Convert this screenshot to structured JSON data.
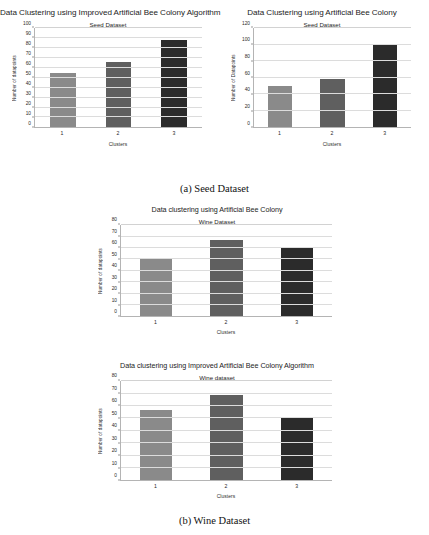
{
  "page": {
    "captions": [
      {
        "id": "a",
        "text": "(a) Seed Dataset"
      },
      {
        "id": "b",
        "text": "(b) Wine Dataset"
      }
    ]
  },
  "palette": {
    "bar_cluster_1": "#8a8a8a",
    "bar_cluster_2": "#5f5f5f",
    "bar_cluster_3": "#2b2b2b",
    "gridline": "#dcdcdc",
    "axis": "#b4b4b4",
    "text": "#1c1c1c",
    "background": "#ffffff"
  },
  "chart_data": [
    {
      "id": "seed-iabc",
      "type": "bar",
      "title": "Data Clustering using Improved Artificial Bee Colony Algorithm",
      "subtitle": "Seed Dataset",
      "xlabel": "Clusters",
      "ylabel": "Number of datapoints",
      "categories": [
        "1",
        "2",
        "3"
      ],
      "values": [
        55,
        66,
        88
      ],
      "ylim": [
        0,
        100
      ],
      "ytick_step": 10,
      "yticks": [
        0,
        10,
        20,
        30,
        40,
        50,
        60,
        70,
        80,
        90,
        100
      ],
      "grid": true,
      "legend": null,
      "bar_colors": [
        "#8a8a8a",
        "#5f5f5f",
        "#2b2b2b"
      ]
    },
    {
      "id": "seed-abc",
      "type": "bar",
      "title": "Data Clustering using Artificial Bee Colony",
      "subtitle": "Seed Dataset",
      "xlabel": "Clusters",
      "ylabel": "Number of Datapoints",
      "categories": [
        "1",
        "2",
        "3"
      ],
      "values": [
        50,
        59,
        100
      ],
      "ylim": [
        0,
        120
      ],
      "ytick_step": 20,
      "yticks": [
        0,
        20,
        40,
        60,
        80,
        100,
        120
      ],
      "grid": true,
      "legend": null,
      "bar_colors": [
        "#8a8a8a",
        "#5f5f5f",
        "#2b2b2b"
      ]
    },
    {
      "id": "wine-abc",
      "type": "bar",
      "title": "Data clustering using Artificial Bee Colony",
      "subtitle": "Wine Dataset",
      "xlabel": "Clusters",
      "ylabel": "Number of datapoints",
      "categories": [
        "1",
        "2",
        "3"
      ],
      "values": [
        51,
        67,
        60
      ],
      "ylim": [
        0,
        80
      ],
      "ytick_step": 10,
      "yticks": [
        0,
        10,
        20,
        30,
        40,
        50,
        60,
        70,
        80
      ],
      "grid": true,
      "legend": null,
      "bar_colors": [
        "#8a8a8a",
        "#5f5f5f",
        "#2b2b2b"
      ]
    },
    {
      "id": "wine-iabc",
      "type": "bar",
      "title": "Data clustering using Improved Artificial Bee Colony Algorithm",
      "subtitle": "Wine dataset",
      "xlabel": "Clusters",
      "ylabel": "Number of datapoints",
      "categories": [
        "1",
        "2",
        "3"
      ],
      "values": [
        57,
        69,
        50
      ],
      "ylim": [
        0,
        80
      ],
      "ytick_step": 10,
      "yticks": [
        0,
        10,
        20,
        30,
        40,
        50,
        60,
        70,
        80
      ],
      "grid": true,
      "legend": null,
      "bar_colors": [
        "#8a8a8a",
        "#5f5f5f",
        "#2b2b2b"
      ]
    }
  ]
}
